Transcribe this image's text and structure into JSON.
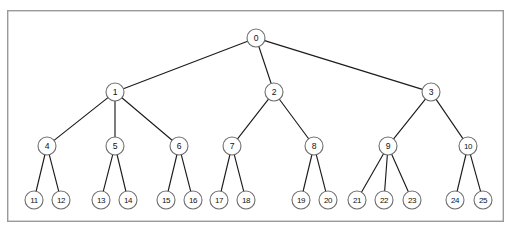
{
  "figure": {
    "type": "tree-diagram",
    "title": "",
    "background_color": "#ffffff",
    "frame": {
      "x": 7,
      "y": 10,
      "width": 497,
      "height": 212,
      "stroke_color": "#9a9a9a",
      "fill_color": "#ffffff"
    },
    "node_style": {
      "radius": 9,
      "stroke_color": "#6e6e6e",
      "fill_color": "#ffffff",
      "label_color": "#111111"
    },
    "edge_style": {
      "stroke_color": "#1c1c1c",
      "stroke_width": 1.15
    }
  },
  "chart_data": {
    "type": "tree",
    "title": "",
    "node_count": 26,
    "depth": 4,
    "root": "0",
    "levels": [
      {
        "level": 0,
        "y": 38,
        "nodes": [
          "0"
        ]
      },
      {
        "level": 1,
        "y": 92,
        "nodes": [
          "1",
          "2",
          "3"
        ]
      },
      {
        "level": 2,
        "y": 146,
        "nodes": [
          "4",
          "5",
          "6",
          "7",
          "8",
          "9",
          "10"
        ]
      },
      {
        "level": 3,
        "y": 200,
        "nodes": [
          "11",
          "12",
          "13",
          "14",
          "15",
          "16",
          "17",
          "18",
          "19",
          "20",
          "21",
          "22",
          "23",
          "24",
          "25"
        ]
      }
    ],
    "nodes": [
      {
        "id": "0",
        "label": "0",
        "x": 256,
        "y": 38,
        "level": 0,
        "parent": null,
        "children": [
          "1",
          "2",
          "3"
        ]
      },
      {
        "id": "1",
        "label": "1",
        "x": 115,
        "y": 92,
        "level": 1,
        "parent": "0",
        "children": [
          "4",
          "5",
          "6"
        ]
      },
      {
        "id": "2",
        "label": "2",
        "x": 274,
        "y": 92,
        "level": 1,
        "parent": "0",
        "children": [
          "7",
          "8"
        ]
      },
      {
        "id": "3",
        "label": "3",
        "x": 431,
        "y": 92,
        "level": 1,
        "parent": "0",
        "children": [
          "9",
          "10"
        ]
      },
      {
        "id": "4",
        "label": "4",
        "x": 47,
        "y": 146,
        "level": 2,
        "parent": "1",
        "children": [
          "11",
          "12"
        ]
      },
      {
        "id": "5",
        "label": "5",
        "x": 115,
        "y": 146,
        "level": 2,
        "parent": "1",
        "children": [
          "13",
          "14"
        ]
      },
      {
        "id": "6",
        "label": "6",
        "x": 179,
        "y": 146,
        "level": 2,
        "parent": "1",
        "children": [
          "15",
          "16"
        ]
      },
      {
        "id": "7",
        "label": "7",
        "x": 232,
        "y": 146,
        "level": 2,
        "parent": "2",
        "children": [
          "17",
          "18"
        ]
      },
      {
        "id": "8",
        "label": "8",
        "x": 314,
        "y": 146,
        "level": 2,
        "parent": "2",
        "children": [
          "19",
          "20"
        ]
      },
      {
        "id": "9",
        "label": "9",
        "x": 388,
        "y": 146,
        "level": 2,
        "parent": "3",
        "children": [
          "21",
          "22",
          "23"
        ]
      },
      {
        "id": "10",
        "label": "10",
        "x": 468,
        "y": 146,
        "level": 2,
        "parent": "3",
        "children": [
          "24",
          "25"
        ]
      },
      {
        "id": "11",
        "label": "11",
        "x": 34,
        "y": 200,
        "level": 3,
        "parent": "4",
        "children": []
      },
      {
        "id": "12",
        "label": "12",
        "x": 61,
        "y": 200,
        "level": 3,
        "parent": "4",
        "children": []
      },
      {
        "id": "13",
        "label": "13",
        "x": 101,
        "y": 200,
        "level": 3,
        "parent": "5",
        "children": []
      },
      {
        "id": "14",
        "label": "14",
        "x": 128,
        "y": 200,
        "level": 3,
        "parent": "5",
        "children": []
      },
      {
        "id": "15",
        "label": "15",
        "x": 166,
        "y": 200,
        "level": 3,
        "parent": "6",
        "children": []
      },
      {
        "id": "16",
        "label": "16",
        "x": 193,
        "y": 200,
        "level": 3,
        "parent": "6",
        "children": []
      },
      {
        "id": "17",
        "label": "17",
        "x": 219,
        "y": 200,
        "level": 3,
        "parent": "7",
        "children": []
      },
      {
        "id": "18",
        "label": "18",
        "x": 246,
        "y": 200,
        "level": 3,
        "parent": "7",
        "children": []
      },
      {
        "id": "19",
        "label": "19",
        "x": 301,
        "y": 200,
        "level": 3,
        "parent": "8",
        "children": []
      },
      {
        "id": "20",
        "label": "20",
        "x": 328,
        "y": 200,
        "level": 3,
        "parent": "8",
        "children": []
      },
      {
        "id": "21",
        "label": "21",
        "x": 357,
        "y": 200,
        "level": 3,
        "parent": "9",
        "children": []
      },
      {
        "id": "22",
        "label": "22",
        "x": 384,
        "y": 200,
        "level": 3,
        "parent": "9",
        "children": []
      },
      {
        "id": "23",
        "label": "23",
        "x": 412,
        "y": 200,
        "level": 3,
        "parent": "9",
        "children": []
      },
      {
        "id": "24",
        "label": "24",
        "x": 455,
        "y": 200,
        "level": 3,
        "parent": "10",
        "children": []
      },
      {
        "id": "25",
        "label": "25",
        "x": 483,
        "y": 200,
        "level": 3,
        "parent": "10",
        "children": []
      }
    ],
    "edges": [
      {
        "from": "0",
        "to": "1"
      },
      {
        "from": "0",
        "to": "2"
      },
      {
        "from": "0",
        "to": "3"
      },
      {
        "from": "1",
        "to": "4"
      },
      {
        "from": "1",
        "to": "5"
      },
      {
        "from": "1",
        "to": "6"
      },
      {
        "from": "2",
        "to": "7"
      },
      {
        "from": "2",
        "to": "8"
      },
      {
        "from": "3",
        "to": "9"
      },
      {
        "from": "3",
        "to": "10"
      },
      {
        "from": "4",
        "to": "11"
      },
      {
        "from": "4",
        "to": "12"
      },
      {
        "from": "5",
        "to": "13"
      },
      {
        "from": "5",
        "to": "14"
      },
      {
        "from": "6",
        "to": "15"
      },
      {
        "from": "6",
        "to": "16"
      },
      {
        "from": "7",
        "to": "17"
      },
      {
        "from": "7",
        "to": "18"
      },
      {
        "from": "8",
        "to": "19"
      },
      {
        "from": "8",
        "to": "20"
      },
      {
        "from": "9",
        "to": "21"
      },
      {
        "from": "9",
        "to": "22"
      },
      {
        "from": "9",
        "to": "23"
      },
      {
        "from": "10",
        "to": "24"
      },
      {
        "from": "10",
        "to": "25"
      }
    ]
  }
}
